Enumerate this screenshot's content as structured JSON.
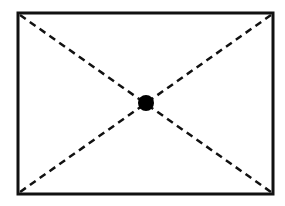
{
  "diagram": {
    "type": "rectangle-with-diagonals",
    "rectangle": {
      "x1": 18,
      "y1": 13,
      "x2": 273,
      "y2": 194,
      "stroke": "#111111",
      "stroke_width": 3
    },
    "diagonals": [
      {
        "from": [
          20,
          15
        ],
        "to": [
          271,
          192
        ],
        "style": "dashed",
        "stroke": "#111111"
      },
      {
        "from": [
          271,
          15
        ],
        "to": [
          20,
          192
        ],
        "style": "dashed",
        "stroke": "#111111"
      }
    ],
    "center_point": {
      "cx": 146,
      "cy": 103,
      "r": 8,
      "fill": "#000000"
    },
    "background": "#ffffff"
  }
}
